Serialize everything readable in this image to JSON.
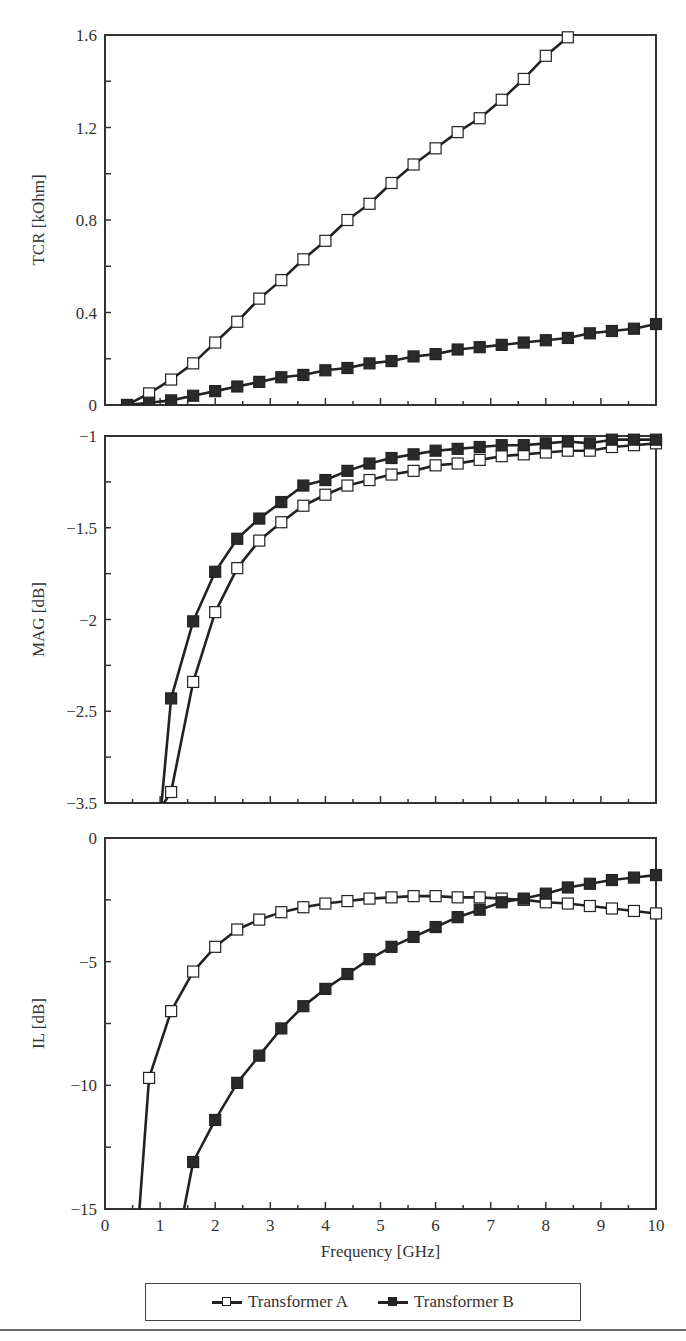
{
  "chart_data": [
    {
      "type": "line",
      "panel": "top",
      "title": "",
      "xlabel": "",
      "ylabel": "TCR [kOhm]",
      "xlim": [
        0,
        10
      ],
      "ylim": [
        0,
        1.6
      ],
      "yticks": [
        0,
        0.4,
        0.8,
        1.2,
        1.6
      ],
      "ytick_labels": [
        "0",
        "0.4",
        "0.8",
        "1.2",
        "1.6"
      ],
      "grid": false,
      "series": [
        {
          "name": "Transformer A",
          "marker": "open-square",
          "x": [
            0.4,
            0.8,
            1.2,
            1.6,
            2.0,
            2.4,
            2.8,
            3.2,
            3.6,
            4.0,
            4.4,
            4.8,
            5.2,
            5.6,
            6.0,
            6.4,
            6.8,
            7.2,
            7.6,
            8.0,
            8.4
          ],
          "values": [
            0.0,
            0.05,
            0.11,
            0.18,
            0.27,
            0.36,
            0.46,
            0.54,
            0.63,
            0.71,
            0.8,
            0.87,
            0.96,
            1.04,
            1.11,
            1.18,
            1.24,
            1.32,
            1.41,
            1.51,
            1.59
          ]
        },
        {
          "name": "Transformer B",
          "marker": "filled-square",
          "x": [
            0.4,
            0.8,
            1.2,
            1.6,
            2.0,
            2.4,
            2.8,
            3.2,
            3.6,
            4.0,
            4.4,
            4.8,
            5.2,
            5.6,
            6.0,
            6.4,
            6.8,
            7.2,
            7.6,
            8.0,
            8.4,
            8.8,
            9.2,
            9.6,
            10.0
          ],
          "values": [
            0.0,
            0.01,
            0.02,
            0.04,
            0.06,
            0.08,
            0.1,
            0.12,
            0.13,
            0.15,
            0.16,
            0.18,
            0.19,
            0.21,
            0.22,
            0.24,
            0.25,
            0.26,
            0.27,
            0.28,
            0.29,
            0.31,
            0.32,
            0.33,
            0.35
          ]
        }
      ]
    },
    {
      "type": "line",
      "panel": "middle",
      "title": "",
      "xlabel": "",
      "ylabel": "MAG [dB]",
      "xlim": [
        0,
        10
      ],
      "ylim": [
        -3.0,
        -1.0
      ],
      "yticks": [
        -1.0,
        -1.5,
        -2.0,
        -2.5,
        -3.0
      ],
      "ytick_labels": [
        "−1",
        "−1.5",
        "−2",
        "−2.5",
        "−3.5"
      ],
      "grid": false,
      "series": [
        {
          "name": "Transformer A",
          "marker": "open-square",
          "x": [
            1.2,
            1.6,
            2.0,
            2.4,
            2.8,
            3.2,
            3.6,
            4.0,
            4.4,
            4.8,
            5.2,
            5.6,
            6.0,
            6.4,
            6.8,
            7.2,
            7.6,
            8.0,
            8.4,
            8.8,
            9.2,
            9.6,
            10.0
          ],
          "values": [
            -2.94,
            -2.34,
            -1.96,
            -1.72,
            -1.57,
            -1.47,
            -1.38,
            -1.32,
            -1.27,
            -1.24,
            -1.21,
            -1.19,
            -1.16,
            -1.15,
            -1.13,
            -1.11,
            -1.1,
            -1.09,
            -1.08,
            -1.08,
            -1.06,
            -1.05,
            -1.04
          ]
        },
        {
          "name": "Transformer B",
          "marker": "filled-square",
          "x": [
            1.2,
            1.6,
            2.0,
            2.4,
            2.8,
            3.2,
            3.6,
            4.0,
            4.4,
            4.8,
            5.2,
            5.6,
            6.0,
            6.4,
            6.8,
            7.2,
            7.6,
            8.0,
            8.4,
            8.8,
            9.2,
            9.6,
            10.0
          ],
          "values": [
            -2.43,
            -2.01,
            -1.74,
            -1.56,
            -1.45,
            -1.36,
            -1.27,
            -1.24,
            -1.19,
            -1.15,
            -1.12,
            -1.1,
            -1.08,
            -1.07,
            -1.06,
            -1.05,
            -1.05,
            -1.04,
            -1.03,
            -1.04,
            -1.02,
            -1.02,
            -1.02
          ]
        }
      ]
    },
    {
      "type": "line",
      "panel": "bottom",
      "title": "",
      "xlabel": "Frequency [GHz]",
      "ylabel": "IL [dB]",
      "xlim": [
        0,
        10
      ],
      "ylim": [
        -15,
        0
      ],
      "xticks": [
        0,
        1,
        2,
        3,
        4,
        5,
        6,
        7,
        8,
        9,
        10
      ],
      "xtick_labels": [
        "0",
        "1",
        "2",
        "3",
        "4",
        "5",
        "6",
        "7",
        "8",
        "9",
        "10"
      ],
      "yticks": [
        0,
        -5,
        -10,
        -15
      ],
      "ytick_labels": [
        "0",
        "−5",
        "−10",
        "−15"
      ],
      "grid": false,
      "series": [
        {
          "name": "Transformer A",
          "marker": "open-square",
          "x": [
            0.8,
            1.2,
            1.6,
            2.0,
            2.4,
            2.8,
            3.2,
            3.6,
            4.0,
            4.4,
            4.8,
            5.2,
            5.6,
            6.0,
            6.4,
            6.8,
            7.2,
            7.6,
            8.0,
            8.4,
            8.8,
            9.2,
            9.6,
            10.0
          ],
          "values": [
            -9.7,
            -7.0,
            -5.4,
            -4.4,
            -3.7,
            -3.3,
            -3.0,
            -2.8,
            -2.65,
            -2.55,
            -2.45,
            -2.4,
            -2.35,
            -2.35,
            -2.4,
            -2.4,
            -2.45,
            -2.5,
            -2.6,
            -2.65,
            -2.75,
            -2.85,
            -2.95,
            -3.05
          ]
        },
        {
          "name": "Transformer B",
          "marker": "filled-square",
          "x": [
            1.6,
            2.0,
            2.4,
            2.8,
            3.2,
            3.6,
            4.0,
            4.4,
            4.8,
            5.2,
            5.6,
            6.0,
            6.4,
            6.8,
            7.2,
            7.6,
            8.0,
            8.4,
            8.8,
            9.2,
            9.6,
            10.0
          ],
          "values": [
            -13.1,
            -11.4,
            -9.9,
            -8.8,
            -7.7,
            -6.8,
            -6.1,
            -5.5,
            -4.9,
            -4.4,
            -4.0,
            -3.6,
            -3.2,
            -2.9,
            -2.6,
            -2.45,
            -2.25,
            -2.0,
            -1.85,
            -1.7,
            -1.6,
            -1.5
          ]
        }
      ]
    }
  ],
  "legend": {
    "position": "bottom-center",
    "items": [
      {
        "label": "Transformer A",
        "marker": "open-square"
      },
      {
        "label": "Transformer B",
        "marker": "filled-square"
      }
    ]
  },
  "colors": {
    "line": "#222222",
    "frame": "#333333",
    "background": "#ffffff"
  }
}
